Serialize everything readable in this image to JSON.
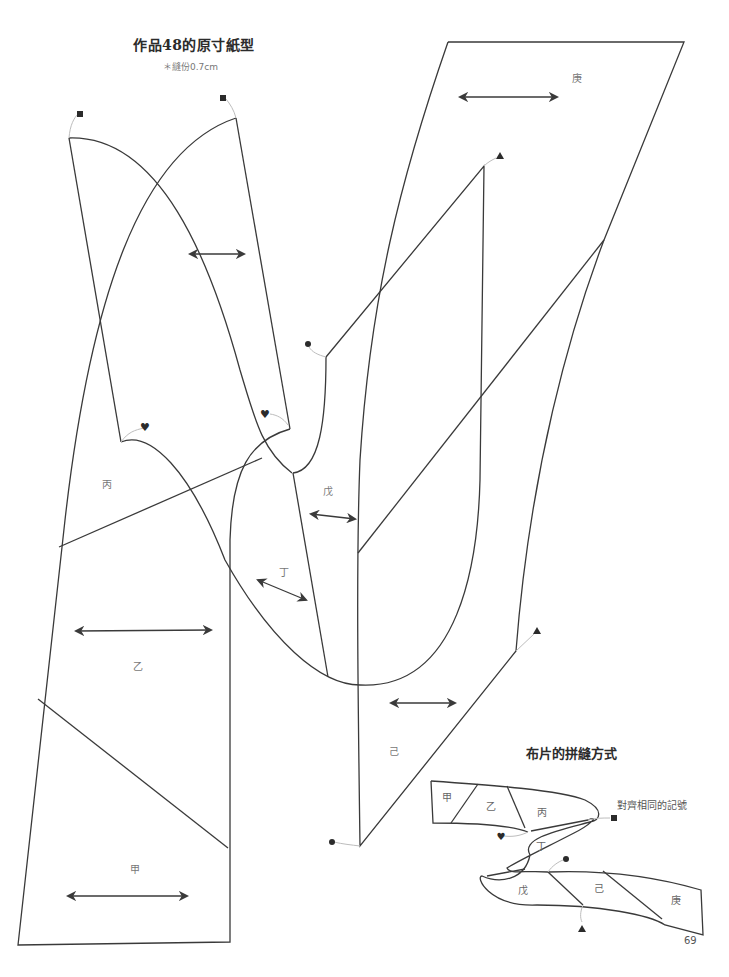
{
  "page": {
    "title": "作品48的原寸紙型",
    "subtitle": "＊縫份0.7cm",
    "page_number": "69"
  },
  "pattern_pieces": [
    {
      "id": "jia",
      "label": "甲"
    },
    {
      "id": "yi",
      "label": "乙"
    },
    {
      "id": "bing",
      "label": "丙"
    },
    {
      "id": "ding",
      "label": "丁"
    },
    {
      "id": "wu",
      "label": "戊"
    },
    {
      "id": "ji",
      "label": "己"
    },
    {
      "id": "geng",
      "label": "庚"
    }
  ],
  "markers": {
    "square": "■",
    "heart": "♥",
    "circle": "●",
    "triangle": "▲"
  },
  "assembly": {
    "title": "布片的拼縫方式",
    "note": "對齊相同的記號",
    "pieces": [
      "甲",
      "乙",
      "丙",
      "丁",
      "戊",
      "己",
      "庚"
    ]
  },
  "colors": {
    "line": "#3a3a3a",
    "leader": "#bdbdbd",
    "text": "#777777",
    "background": "#ffffff"
  }
}
